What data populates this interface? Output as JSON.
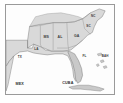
{
  "figure": {
    "kind": "reference-map",
    "frame": {
      "border_color": "#9a9a9a",
      "background": "#ffffff"
    }
  },
  "colors": {
    "land": "#d9d9d9",
    "land_dark": "#c9c9c9",
    "water": "#fdfdfd",
    "border_line": "#8c8c8c",
    "coast_line": "#6f6f6f",
    "label_text": "#3a3a3a",
    "frame": "#9a9a9a"
  },
  "map": {
    "states": [
      {
        "code": "TX",
        "name": "Texas",
        "label_x": 14,
        "label_y": 53
      },
      {
        "code": "LA",
        "name": "Louisiana",
        "label_x": 31,
        "label_y": 45
      },
      {
        "code": "MS",
        "name": "Mississippi",
        "label_x": 41,
        "label_y": 33
      },
      {
        "code": "AL",
        "name": "Alabama",
        "label_x": 55,
        "label_y": 33
      },
      {
        "code": "GA",
        "name": "Georgia",
        "label_x": 72,
        "label_y": 32
      },
      {
        "code": "FL",
        "name": "Florida",
        "label_x": 80,
        "label_y": 52
      },
      {
        "code": "SC",
        "name": "South Carolina",
        "label_x": 84,
        "label_y": 22
      },
      {
        "code": "NC",
        "name": "North Carolina",
        "label_x": 89,
        "label_y": 11
      }
    ],
    "countries": [
      {
        "code": "MEX",
        "name": "Mexico",
        "label_x": 14,
        "label_y": 81
      },
      {
        "code": "CUBA",
        "name": "Cuba",
        "label_x": 63,
        "label_y": 80
      },
      {
        "code": "BAH",
        "name": "Bahamas",
        "label_x": 101,
        "label_y": 52
      }
    ]
  }
}
